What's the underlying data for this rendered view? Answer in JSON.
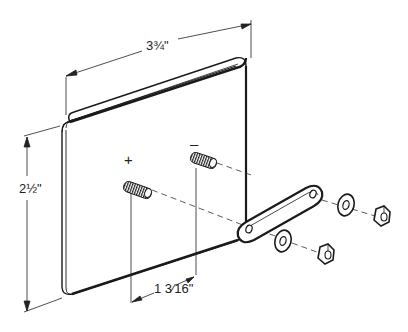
{
  "diagram": {
    "type": "exploded technical drawing",
    "colors": {
      "ink": "#1a1a1a",
      "paper": "#ffffff"
    },
    "dimensions": {
      "width": "3¾\"",
      "height": "2½\"",
      "terminal_spacing": "1 3⁄16\""
    },
    "labels": {
      "positive": "+",
      "negative": "–"
    },
    "parts": [
      "plate",
      "threaded-stud-positive",
      "threaded-stud-negative",
      "connector-strap",
      "washer",
      "washer",
      "hex-nut",
      "hex-nut"
    ]
  }
}
